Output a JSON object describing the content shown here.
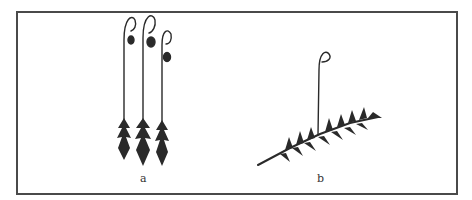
{
  "figure": {
    "panels": [
      {
        "id": "a",
        "label": "a",
        "description": "three upright moss shoots with long setae and curved capsules"
      },
      {
        "id": "b",
        "label": "b",
        "description": "creeping pinnate moss shoot with single seta and capsule"
      }
    ],
    "colors": {
      "ink": "#2a2a2a",
      "frame": "#4a4a4a",
      "background": "#ffffff"
    }
  }
}
